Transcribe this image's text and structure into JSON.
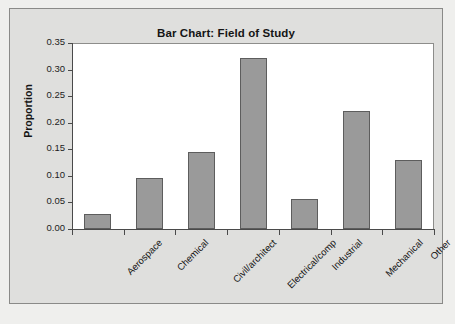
{
  "chart_data": {
    "type": "bar",
    "title": "Bar Chart: Field of Study",
    "xlabel": "",
    "ylabel": "Proportion",
    "categories": [
      "Aerospace",
      "Chemical",
      "Civil/architect",
      "Electrical/comp",
      "Industrial",
      "Mechanical",
      "Other"
    ],
    "values": [
      0.029,
      0.096,
      0.145,
      0.322,
      0.057,
      0.222,
      0.129
    ],
    "ylim": [
      0.0,
      0.35
    ],
    "ytick_labels": [
      "0.00",
      "0.05",
      "0.10",
      "0.15",
      "0.20",
      "0.25",
      "0.30",
      "0.35"
    ],
    "ytick_values": [
      0.0,
      0.05,
      0.1,
      0.15,
      0.2,
      0.25,
      0.3,
      0.35
    ],
    "grid": false,
    "legend": false,
    "bar_color": "#9a9a9a",
    "bar_edge_color": "#5d5d5d",
    "plot_background": "#ffffff",
    "panel_background": "#dfdfdd",
    "page_background": "#efefed"
  }
}
